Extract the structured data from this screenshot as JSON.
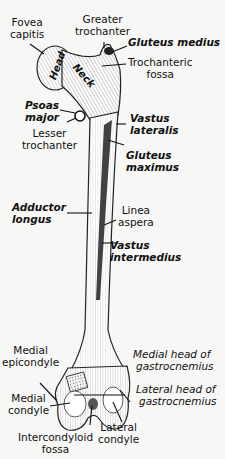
{
  "figure": {
    "background": "#f7f7f5",
    "ink": "#111111"
  },
  "bone_labels": {
    "head": "Head",
    "neck": "Neck"
  },
  "labels": {
    "fovea_capitis": [
      "Fovea",
      "capitis"
    ],
    "greater_trochanter": [
      "Greater",
      "trochanter"
    ],
    "gluteus_medius": [
      "Gluteus medius"
    ],
    "trochanteric_fossa": [
      "Trochanteric",
      "fossa"
    ],
    "psoas_major": [
      "Psoas",
      "major"
    ],
    "lesser_trochanter": [
      "Lesser",
      "trochanter"
    ],
    "vastus_lateralis": [
      "Vastus",
      "lateralis"
    ],
    "gluteus_maximus": [
      "Gluteus",
      "maximus"
    ],
    "adductor_longus": [
      "Adductor",
      "longus"
    ],
    "linea_aspera": [
      "Linea",
      "aspera"
    ],
    "vastus_intermedius": [
      "Vastus",
      "intermedius"
    ],
    "medial_epicondyle": [
      "Medial",
      "epicondyle"
    ],
    "medial_head_gastrocnemius": [
      "Medial head of",
      "gastrocnemius"
    ],
    "lateral_head_gastrocnemius": [
      "Lateral head of",
      "gastrocnemius"
    ],
    "medial_condyle": [
      "Medial",
      "condyle"
    ],
    "lateral_condyle": [
      "Lateral",
      "condyle"
    ],
    "intercondyloid_fossa": [
      "Intercondyloid",
      "fossa"
    ]
  }
}
